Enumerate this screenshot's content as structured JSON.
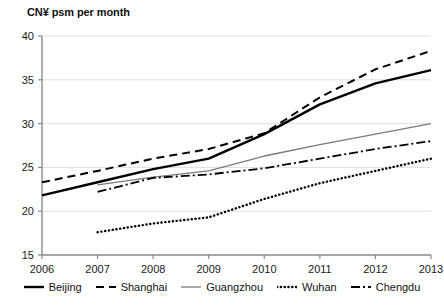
{
  "chart_data": {
    "type": "line",
    "title": "CN¥ psm per month",
    "xlabel": "",
    "ylabel": "",
    "x": [
      2006,
      2007,
      2008,
      2009,
      2010,
      2011,
      2012,
      2013
    ],
    "categories": [
      "2006",
      "2007",
      "2008",
      "2009",
      "2010",
      "2011",
      "2012",
      "2013"
    ],
    "ylim": [
      15,
      40
    ],
    "xlim": [
      2006,
      2013
    ],
    "yticks": [
      15,
      20,
      25,
      30,
      35,
      40
    ],
    "ytick_labels": [
      "15",
      "20",
      "25",
      "30",
      "35",
      "40"
    ],
    "xtick_labels": [
      "2006",
      "2007",
      "2008",
      "2009",
      "2010",
      "2011",
      "2012",
      "2013"
    ],
    "grid": "horizontal",
    "legend_position": "bottom",
    "series": [
      {
        "name": "Beijing",
        "style": "solid-thick",
        "color": "#000000",
        "x": [
          2006,
          2007,
          2008,
          2009,
          2010,
          2011,
          2012,
          2013
        ],
        "values": [
          21.8,
          23.3,
          24.8,
          26.0,
          28.8,
          32.2,
          34.6,
          36.1
        ]
      },
      {
        "name": "Shanghai",
        "style": "dashed",
        "color": "#000000",
        "x": [
          2006,
          2007,
          2008,
          2009,
          2010,
          2011,
          2012,
          2013
        ],
        "values": [
          23.3,
          24.6,
          26.0,
          27.1,
          28.9,
          33.0,
          36.2,
          38.3
        ]
      },
      {
        "name": "Guangzhou",
        "style": "solid-thin",
        "color": "#7a7a7a",
        "x": [
          2007,
          2008,
          2009,
          2010,
          2011,
          2012,
          2013
        ],
        "values": [
          23.0,
          23.9,
          24.6,
          26.3,
          27.6,
          28.8,
          30.0
        ]
      },
      {
        "name": "Wuhan",
        "style": "dotted",
        "color": "#000000",
        "x": [
          2007,
          2008,
          2009,
          2010,
          2011,
          2012,
          2013
        ],
        "values": [
          17.6,
          18.6,
          19.3,
          21.4,
          23.2,
          24.6,
          26.0
        ]
      },
      {
        "name": "Chengdu",
        "style": "dash-dot",
        "color": "#000000",
        "x": [
          2007,
          2008,
          2009,
          2010,
          2011,
          2012,
          2013
        ],
        "values": [
          22.2,
          23.8,
          24.2,
          24.9,
          26.0,
          27.1,
          28.0
        ]
      }
    ]
  },
  "legend": {
    "items": [
      {
        "label": "Beijing"
      },
      {
        "label": "Shanghai"
      },
      {
        "label": "Guangzhou"
      },
      {
        "label": "Wuhan"
      },
      {
        "label": "Chengdu"
      }
    ]
  }
}
